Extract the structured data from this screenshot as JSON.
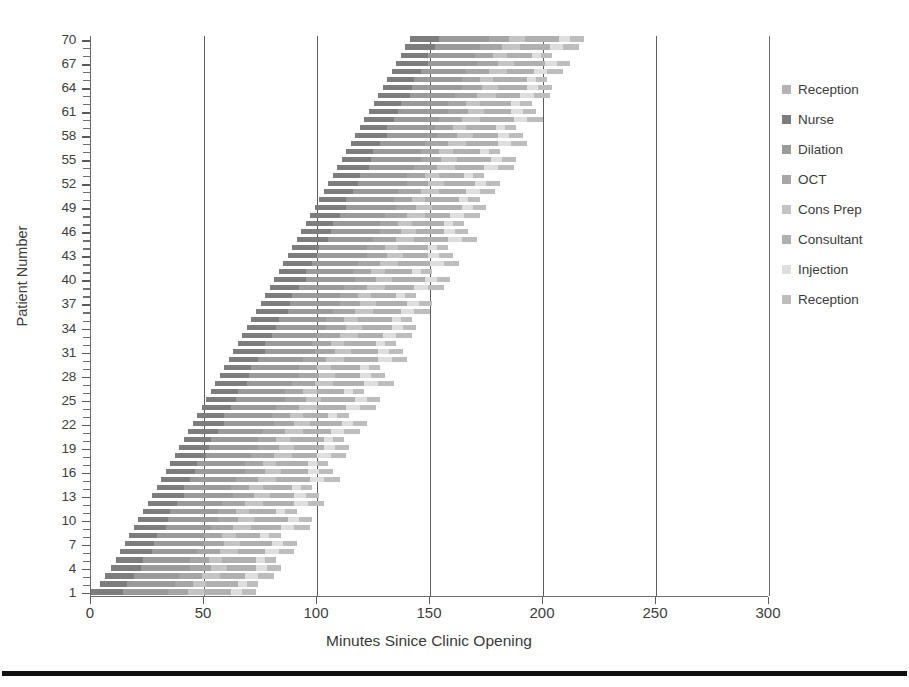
{
  "chart_data": {
    "type": "bar",
    "orientation": "horizontal",
    "stacked": true,
    "title": "",
    "xlabel": "Minutes Sinice Clinic Opening",
    "ylabel": "Patient Number",
    "xlim": [
      0,
      300
    ],
    "ylim": [
      1,
      70
    ],
    "xticks": [
      0,
      50,
      100,
      150,
      200,
      250,
      300
    ],
    "ytick_step": 3,
    "yticks": [
      1,
      4,
      7,
      10,
      13,
      16,
      19,
      22,
      25,
      28,
      31,
      34,
      37,
      40,
      43,
      46,
      49,
      52,
      55,
      58,
      61,
      64,
      67,
      70
    ],
    "grid": "vertical",
    "legend_position": "right",
    "categories": [
      1,
      2,
      3,
      4,
      5,
      6,
      7,
      8,
      9,
      10,
      11,
      12,
      13,
      14,
      15,
      16,
      17,
      18,
      19,
      20,
      21,
      22,
      23,
      24,
      25,
      26,
      27,
      28,
      29,
      30,
      31,
      32,
      33,
      34,
      35,
      36,
      37,
      38,
      39,
      40,
      41,
      42,
      43,
      44,
      45,
      46,
      47,
      48,
      49,
      50,
      51,
      52,
      53,
      54,
      55,
      56,
      57,
      58,
      59,
      60,
      61,
      62,
      63,
      64,
      65,
      66,
      67,
      68,
      69,
      70
    ],
    "series": [
      {
        "name": "Reception",
        "color": "#b4b4b4",
        "values": [
          0,
          4,
          6,
          9,
          11,
          13,
          15,
          17,
          19,
          21,
          23,
          25,
          27,
          29,
          31,
          33,
          35,
          37,
          39,
          41,
          43,
          45,
          47,
          49,
          51,
          53,
          55,
          57,
          59,
          61,
          63,
          65,
          67,
          69,
          71,
          73,
          75,
          77,
          79,
          81,
          83,
          85,
          87,
          89,
          91,
          93,
          95,
          97,
          99,
          101,
          103,
          105,
          107,
          109,
          111,
          113,
          115,
          117,
          119,
          121,
          123,
          125,
          127,
          129,
          131,
          133,
          135,
          137,
          139,
          141
        ]
      },
      {
        "name": "Nurse",
        "color": "#7d7d7d",
        "values": [
          14,
          12,
          13,
          13,
          12,
          14,
          13,
          12,
          14,
          13,
          12,
          13,
          14,
          12,
          13,
          13,
          12,
          14,
          13,
          12,
          13,
          14,
          12,
          13,
          13,
          12,
          14,
          13,
          12,
          13,
          14,
          12,
          13,
          13,
          12,
          14,
          13,
          12,
          13,
          14,
          12,
          13,
          13,
          12,
          14,
          13,
          12,
          13,
          14,
          12,
          13,
          13,
          12,
          14,
          13,
          12,
          13,
          14,
          12,
          13,
          13,
          12,
          14,
          13,
          12,
          13,
          14,
          12,
          13,
          13
        ]
      },
      {
        "name": "Dilation",
        "color": "#9a9a9a",
        "values": [
          20,
          21,
          20,
          22,
          21,
          20,
          22,
          21,
          20,
          22,
          21,
          20,
          22,
          21,
          20,
          22,
          21,
          20,
          22,
          21,
          20,
          22,
          21,
          20,
          22,
          21,
          20,
          22,
          21,
          20,
          22,
          21,
          20,
          22,
          21,
          20,
          22,
          21,
          20,
          22,
          21,
          20,
          22,
          21,
          20,
          22,
          21,
          20,
          22,
          21,
          20,
          22,
          21,
          20,
          22,
          21,
          20,
          22,
          21,
          20,
          22,
          21,
          20,
          22,
          21,
          20,
          22,
          21,
          20,
          22
        ]
      },
      {
        "name": "OCT",
        "color": "#a6a6a6",
        "values": [
          9,
          8,
          10,
          9,
          8,
          10,
          9,
          8,
          10,
          9,
          8,
          10,
          9,
          8,
          10,
          9,
          8,
          10,
          9,
          8,
          10,
          9,
          8,
          10,
          9,
          8,
          10,
          9,
          8,
          10,
          9,
          8,
          10,
          9,
          8,
          10,
          9,
          8,
          10,
          9,
          8,
          10,
          9,
          8,
          10,
          9,
          8,
          10,
          9,
          8,
          10,
          9,
          8,
          10,
          9,
          8,
          10,
          9,
          8,
          10,
          9,
          8,
          10,
          9,
          8,
          10,
          9,
          8,
          10,
          9
        ]
      },
      {
        "name": "Cons Prep",
        "color": "#c4c4c4",
        "values": [
          7,
          6,
          8,
          7,
          6,
          8,
          7,
          6,
          8,
          7,
          6,
          8,
          7,
          6,
          8,
          7,
          6,
          8,
          7,
          6,
          8,
          7,
          6,
          8,
          7,
          6,
          8,
          7,
          6,
          8,
          7,
          6,
          8,
          7,
          6,
          8,
          7,
          6,
          8,
          7,
          6,
          8,
          7,
          6,
          8,
          7,
          6,
          8,
          7,
          6,
          8,
          7,
          6,
          8,
          7,
          6,
          8,
          7,
          6,
          8,
          7,
          6,
          8,
          7,
          6,
          8,
          7,
          6,
          8,
          7
        ]
      },
      {
        "name": "Consultant",
        "color": "#b0b0b0",
        "values": [
          12,
          14,
          11,
          13,
          15,
          12,
          14,
          11,
          13,
          15,
          12,
          14,
          11,
          13,
          15,
          12,
          14,
          11,
          13,
          15,
          12,
          14,
          11,
          13,
          15,
          12,
          14,
          11,
          13,
          15,
          12,
          14,
          11,
          13,
          15,
          12,
          14,
          11,
          13,
          15,
          12,
          14,
          11,
          13,
          15,
          12,
          14,
          11,
          13,
          15,
          12,
          14,
          11,
          13,
          15,
          12,
          14,
          11,
          13,
          15,
          12,
          14,
          11,
          13,
          15,
          12,
          14,
          11,
          13,
          15
        ]
      },
      {
        "name": "Injection",
        "color": "#dedede",
        "values": [
          5,
          4,
          6,
          5,
          4,
          6,
          5,
          4,
          6,
          5,
          4,
          6,
          5,
          4,
          6,
          5,
          4,
          6,
          5,
          4,
          6,
          5,
          4,
          6,
          5,
          4,
          6,
          5,
          4,
          6,
          5,
          4,
          6,
          5,
          4,
          6,
          5,
          4,
          6,
          5,
          4,
          6,
          5,
          4,
          6,
          5,
          4,
          6,
          5,
          4,
          6,
          5,
          4,
          6,
          5,
          4,
          6,
          5,
          4,
          6,
          5,
          4,
          6,
          5,
          4,
          6,
          5,
          4,
          6,
          5
        ]
      },
      {
        "name": "Reception",
        "color": "#bdbdbd",
        "values": [
          6,
          5,
          7,
          6,
          5,
          7,
          6,
          5,
          7,
          6,
          5,
          7,
          6,
          5,
          7,
          6,
          5,
          7,
          6,
          5,
          7,
          6,
          5,
          7,
          6,
          5,
          7,
          6,
          5,
          7,
          6,
          5,
          7,
          6,
          5,
          7,
          6,
          5,
          7,
          6,
          5,
          7,
          6,
          5,
          7,
          6,
          5,
          7,
          6,
          5,
          7,
          6,
          5,
          7,
          6,
          5,
          7,
          6,
          5,
          7,
          6,
          5,
          7,
          6,
          5,
          7,
          6,
          5,
          7,
          6
        ]
      }
    ],
    "legend": [
      {
        "label": "Reception",
        "color": "#b4b4b4"
      },
      {
        "label": "Nurse",
        "color": "#7d7d7d"
      },
      {
        "label": "Dilation",
        "color": "#9a9a9a"
      },
      {
        "label": "OCT",
        "color": "#a6a6a6"
      },
      {
        "label": "Cons Prep",
        "color": "#c4c4c4"
      },
      {
        "label": "Consultant",
        "color": "#b0b0b0"
      },
      {
        "label": "Injection",
        "color": "#dedede"
      },
      {
        "label": "Reception",
        "color": "#bdbdbd"
      }
    ]
  },
  "axes": {
    "x_title": "Minutes Sinice Clinic Opening",
    "y_title": "Patient Number"
  },
  "style": {
    "gridline_color": "#5d5d5d",
    "axis_color": "#6b6b6b",
    "text_color": "#3a3a3a",
    "background": "#ffffff",
    "rule_color": "#111111"
  }
}
